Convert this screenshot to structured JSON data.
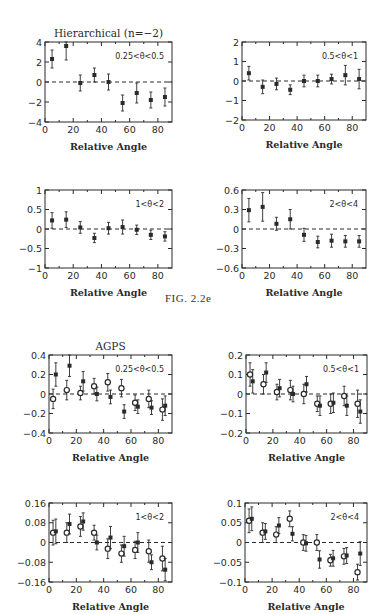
{
  "figure_caption": "FIG. 2.2e",
  "sections": [
    {
      "title": "Hierarchical (n=−2)"
    },
    {
      "title": "AGPS"
    }
  ],
  "chart_data": [
    {
      "type": "scatter",
      "group": "Hierarchical (n=−2)",
      "title": "Hierarchical (n=−2)",
      "annotation": "0.25<θ<0.5",
      "xlabel": "Relative Angle",
      "ylabel": "",
      "xlim": [
        0,
        90
      ],
      "ylim": [
        -4,
        4
      ],
      "xticks": [
        0,
        20,
        40,
        60,
        80
      ],
      "yticks": [
        -4,
        -2,
        0,
        2,
        4
      ],
      "ytick_labels": [
        "−4",
        "−2",
        "0",
        "2",
        "4"
      ],
      "zero_line": "dashed",
      "frame": {
        "x": 45,
        "y": 42,
        "w": 127,
        "h": 80
      },
      "series": [
        {
          "name": "filled",
          "marker": "square",
          "x": [
            5,
            15,
            25,
            35,
            45,
            55,
            65,
            75,
            85
          ],
          "y": [
            2.3,
            3.6,
            -0.1,
            0.7,
            0.0,
            -2.1,
            -1.1,
            -1.8,
            -1.5
          ],
          "err": [
            0.9,
            1.4,
            0.8,
            0.7,
            0.8,
            0.8,
            1.0,
            0.8,
            0.9
          ]
        }
      ]
    },
    {
      "type": "scatter",
      "group": "Hierarchical (n=−2)",
      "title": "",
      "annotation": "0.5<θ<1",
      "xlabel": "Relative Angle",
      "ylabel": "",
      "xlim": [
        0,
        90
      ],
      "ylim": [
        -2,
        2
      ],
      "xticks": [
        0,
        20,
        40,
        60,
        80
      ],
      "yticks": [
        -2,
        -1,
        0,
        1,
        2
      ],
      "ytick_labels": [
        "−2",
        "−1",
        "0",
        "1",
        "2"
      ],
      "zero_line": "dashed",
      "frame": {
        "x": 242,
        "y": 42,
        "w": 124,
        "h": 78
      },
      "series": [
        {
          "name": "filled",
          "marker": "square",
          "x": [
            5,
            15,
            25,
            35,
            45,
            55,
            65,
            75,
            85
          ],
          "y": [
            0.4,
            -0.3,
            -0.15,
            -0.45,
            0.0,
            0.0,
            0.1,
            0.3,
            0.1
          ],
          "err": [
            0.35,
            0.35,
            0.3,
            0.25,
            0.3,
            0.3,
            0.25,
            0.5,
            0.5
          ]
        }
      ]
    },
    {
      "type": "scatter",
      "group": "Hierarchical (n=−2)",
      "title": "",
      "annotation": "1<θ<2",
      "xlabel": "Relative Angle",
      "ylabel": "",
      "xlim": [
        0,
        90
      ],
      "ylim": [
        -1,
        1
      ],
      "xticks": [
        0,
        20,
        40,
        60,
        80
      ],
      "yticks": [
        -1,
        -0.5,
        0,
        0.5,
        1
      ],
      "ytick_labels": [
        "−1",
        "−0.5",
        "0",
        "0.5",
        "1"
      ],
      "zero_line": "dashed",
      "frame": {
        "x": 45,
        "y": 190,
        "w": 127,
        "h": 78
      },
      "series": [
        {
          "name": "filled",
          "marker": "square",
          "x": [
            5,
            15,
            25,
            35,
            45,
            55,
            65,
            75,
            85
          ],
          "y": [
            0.22,
            0.24,
            0.04,
            -0.23,
            0.02,
            0.05,
            -0.02,
            -0.15,
            -0.19
          ],
          "err": [
            0.2,
            0.2,
            0.15,
            0.12,
            0.15,
            0.18,
            0.12,
            0.12,
            0.12
          ]
        }
      ]
    },
    {
      "type": "scatter",
      "group": "Hierarchical (n=−2)",
      "title": "",
      "annotation": "2<θ<4",
      "xlabel": "Relative Angle",
      "ylabel": "",
      "xlim": [
        0,
        90
      ],
      "ylim": [
        -0.6,
        0.6
      ],
      "xticks": [
        0,
        20,
        40,
        60,
        80
      ],
      "yticks": [
        -0.6,
        -0.3,
        0,
        0.3,
        0.6
      ],
      "ytick_labels": [
        "−0.6",
        "−0.3",
        "0",
        "0.3",
        "0.6"
      ],
      "zero_line": "dashed",
      "frame": {
        "x": 242,
        "y": 190,
        "w": 124,
        "h": 78
      },
      "series": [
        {
          "name": "filled",
          "marker": "square",
          "x": [
            5,
            15,
            25,
            35,
            45,
            55,
            65,
            75,
            85
          ],
          "y": [
            0.29,
            0.34,
            0.08,
            0.15,
            -0.09,
            -0.2,
            -0.18,
            -0.19,
            -0.19
          ],
          "err": [
            0.18,
            0.22,
            0.1,
            0.15,
            0.1,
            0.09,
            0.1,
            0.09,
            0.09
          ]
        }
      ]
    },
    {
      "type": "scatter",
      "group": "AGPS",
      "title": "AGPS",
      "annotation": "0.25<θ<0.5",
      "xlabel": "Relative Angle",
      "ylabel": "",
      "xlim": [
        0,
        90
      ],
      "ylim": [
        -0.4,
        0.4
      ],
      "xticks": [
        0,
        20,
        40,
        60,
        80
      ],
      "yticks": [
        -0.4,
        -0.2,
        0,
        0.2,
        0.4
      ],
      "ytick_labels": [
        "−0.4",
        "−0.2",
        "0",
        "0.2",
        "0.4"
      ],
      "zero_line": "dashed",
      "frame": {
        "x": 49,
        "y": 355,
        "w": 123,
        "h": 78
      },
      "series": [
        {
          "name": "open",
          "marker": "circle",
          "x": [
            3,
            13,
            23,
            33,
            43,
            53,
            63,
            73,
            83
          ],
          "y": [
            -0.05,
            0.04,
            0.01,
            0.08,
            0.12,
            0.06,
            -0.09,
            -0.05,
            -0.16
          ],
          "err": [
            0.1,
            0.1,
            0.07,
            0.08,
            0.09,
            0.09,
            0.08,
            0.09,
            0.11
          ]
        },
        {
          "name": "filled",
          "marker": "square",
          "x": [
            5,
            15,
            25,
            35,
            45,
            55,
            65,
            75,
            85
          ],
          "y": [
            0.2,
            0.29,
            0.13,
            0.0,
            -0.03,
            -0.18,
            -0.13,
            -0.14,
            -0.12
          ],
          "err": [
            0.12,
            0.11,
            0.1,
            0.07,
            0.07,
            0.07,
            0.07,
            0.07,
            0.1
          ]
        }
      ]
    },
    {
      "type": "scatter",
      "group": "AGPS",
      "title": "",
      "annotation": "0.5<θ<1",
      "xlabel": "Relative Angle",
      "ylabel": "",
      "xlim": [
        0,
        90
      ],
      "ylim": [
        -0.2,
        0.2
      ],
      "xticks": [
        0,
        20,
        40,
        60,
        80
      ],
      "yticks": [
        -0.2,
        -0.1,
        0,
        0.1,
        0.2
      ],
      "ytick_labels": [
        "−0.2",
        "−0.1",
        "0",
        "0.1",
        "0.2"
      ],
      "zero_line": "dashed",
      "frame": {
        "x": 246,
        "y": 355,
        "w": 121,
        "h": 78
      },
      "series": [
        {
          "name": "open",
          "marker": "circle",
          "x": [
            3,
            13,
            23,
            33,
            43,
            53,
            63,
            73,
            83
          ],
          "y": [
            0.1,
            0.05,
            0.01,
            0.02,
            0.0,
            -0.05,
            -0.05,
            -0.01,
            -0.05
          ],
          "err": [
            0.06,
            0.05,
            0.04,
            0.05,
            0.05,
            0.04,
            0.05,
            0.05,
            0.07
          ]
        },
        {
          "name": "filled",
          "marker": "square",
          "x": [
            5,
            15,
            25,
            35,
            45,
            55,
            65,
            75,
            85
          ],
          "y": [
            0.065,
            0.11,
            0.03,
            0.0,
            0.05,
            -0.06,
            -0.045,
            -0.06,
            -0.09
          ],
          "err": [
            0.06,
            0.05,
            0.045,
            0.04,
            0.04,
            0.05,
            0.05,
            0.05,
            0.06
          ]
        }
      ]
    },
    {
      "type": "scatter",
      "group": "AGPS",
      "title": "",
      "annotation": "1<θ<2",
      "xlabel": "Relative Angle",
      "ylabel": "",
      "xlim": [
        0,
        90
      ],
      "ylim": [
        -0.16,
        0.16
      ],
      "xticks": [
        0,
        20,
        40,
        60,
        80
      ],
      "yticks": [
        -0.16,
        -0.08,
        0,
        0.08,
        0.16
      ],
      "ytick_labels": [
        "−0.16",
        "−0.08",
        "0",
        "0.08",
        "0.16"
      ],
      "zero_line": "dashed",
      "frame": {
        "x": 49,
        "y": 503,
        "w": 123,
        "h": 79
      },
      "series": [
        {
          "name": "open",
          "marker": "circle",
          "x": [
            3,
            13,
            23,
            33,
            43,
            53,
            63,
            73,
            83
          ],
          "y": [
            0.04,
            0.04,
            0.065,
            0.04,
            -0.025,
            -0.045,
            -0.03,
            -0.035,
            -0.065
          ],
          "err": [
            0.05,
            0.04,
            0.04,
            0.03,
            0.04,
            0.035,
            0.035,
            0.045,
            0.05
          ]
        },
        {
          "name": "filled",
          "marker": "square",
          "x": [
            5,
            15,
            25,
            35,
            45,
            55,
            65,
            75,
            85
          ],
          "y": [
            0.045,
            0.075,
            0.085,
            0.0,
            0.02,
            -0.015,
            0.0,
            -0.08,
            -0.11
          ],
          "err": [
            0.05,
            0.04,
            0.035,
            0.03,
            0.045,
            0.04,
            0.04,
            0.03,
            0.045
          ]
        }
      ]
    },
    {
      "type": "scatter",
      "group": "AGPS",
      "title": "",
      "annotation": "2<θ<4",
      "xlabel": "Relative Angle",
      "ylabel": "",
      "xlim": [
        0,
        90
      ],
      "ylim": [
        -0.1,
        0.1
      ],
      "xticks": [
        0,
        20,
        40,
        60,
        80
      ],
      "yticks": [
        -0.1,
        -0.05,
        0,
        0.05,
        0.1
      ],
      "ytick_labels": [
        "−0.1",
        "−0.05",
        "0",
        "0.05",
        "0.1"
      ],
      "zero_line": "dashed",
      "frame": {
        "x": 245,
        "y": 503,
        "w": 122,
        "h": 79
      },
      "series": [
        {
          "name": "open",
          "marker": "circle",
          "x": [
            3,
            13,
            23,
            33,
            43,
            53,
            63,
            73,
            83
          ],
          "y": [
            0.055,
            0.025,
            0.02,
            0.06,
            0.0,
            0.0,
            -0.045,
            -0.035,
            -0.075
          ],
          "err": [
            0.03,
            0.025,
            0.02,
            0.02,
            0.02,
            0.02,
            0.015,
            0.02,
            0.02
          ]
        },
        {
          "name": "filled",
          "marker": "square",
          "x": [
            5,
            15,
            25,
            35,
            45,
            55,
            65,
            75,
            85
          ],
          "y": [
            0.06,
            0.028,
            0.043,
            0.022,
            -0.002,
            -0.043,
            -0.04,
            -0.033,
            -0.028
          ],
          "err": [
            0.03,
            0.02,
            0.02,
            0.018,
            0.02,
            0.022,
            0.02,
            0.02,
            0.03
          ]
        }
      ]
    }
  ]
}
